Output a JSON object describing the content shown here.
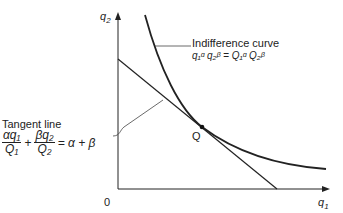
{
  "diagram": {
    "axes": {
      "y_label": "q",
      "y_sub": "2",
      "x_label": "q",
      "x_sub": "1",
      "origin": "0"
    },
    "indifference": {
      "title": "Indifference curve",
      "formula_lhs": "q₁ᵅ q₂ᵝ",
      "equals": "=",
      "formula_rhs": "Q₁ᵅ Q₂ᵝ"
    },
    "tangent": {
      "title": "Tangent line",
      "term1_num": "αq₁",
      "term1_den": "Q₁",
      "plus": "+",
      "term2_num": "βq₂",
      "term2_den": "Q₂",
      "rhs": "= α + β"
    },
    "point": {
      "label": "Q"
    }
  }
}
